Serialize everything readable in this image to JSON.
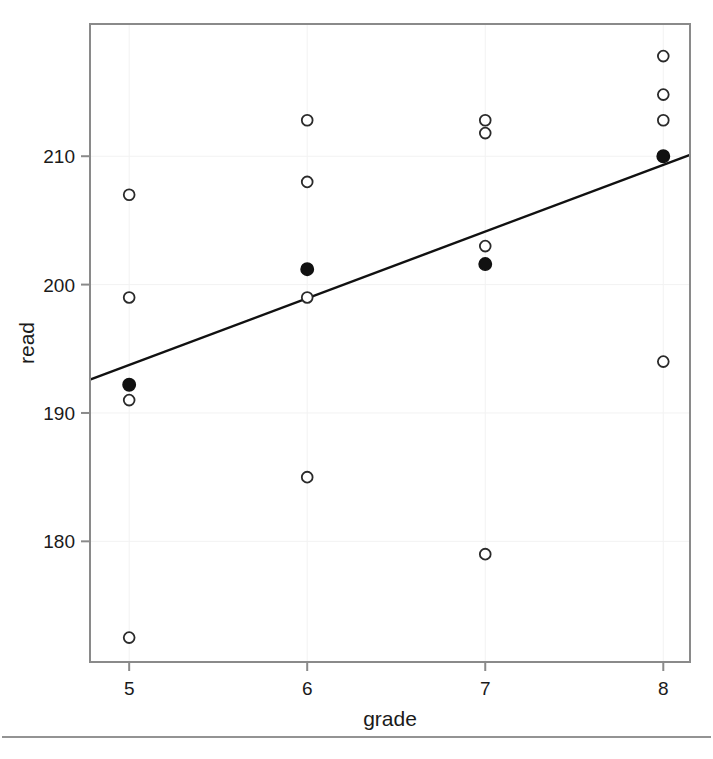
{
  "chart_data": {
    "type": "scatter",
    "title": "",
    "xlabel": "grade",
    "ylabel": "read",
    "xlim": [
      4.78,
      8.15
    ],
    "ylim": [
      170.6,
      220.3
    ],
    "xticks": [
      5,
      6,
      7,
      8
    ],
    "xtick_labels": [
      "5",
      "6",
      "7",
      "8"
    ],
    "yticks": [
      180,
      190,
      200,
      210
    ],
    "ytick_labels": [
      "180",
      "190",
      "200",
      "210"
    ],
    "grid": "faint",
    "legend": "none",
    "series": [
      {
        "name": "individual observations",
        "marker": "open-circle",
        "color": "#2a2a2a",
        "points": [
          {
            "x": 5,
            "y": 207
          },
          {
            "x": 5,
            "y": 199
          },
          {
            "x": 5,
            "y": 191
          },
          {
            "x": 5,
            "y": 172.5
          },
          {
            "x": 6,
            "y": 212.8
          },
          {
            "x": 6,
            "y": 208
          },
          {
            "x": 6,
            "y": 199
          },
          {
            "x": 6,
            "y": 185
          },
          {
            "x": 7,
            "y": 212.8
          },
          {
            "x": 7,
            "y": 211.8
          },
          {
            "x": 7,
            "y": 203
          },
          {
            "x": 7,
            "y": 179
          },
          {
            "x": 8,
            "y": 217.8
          },
          {
            "x": 8,
            "y": 214.8
          },
          {
            "x": 8,
            "y": 212.8
          },
          {
            "x": 8,
            "y": 194
          }
        ]
      },
      {
        "name": "group means",
        "marker": "filled-circle",
        "color": "#111111",
        "points": [
          {
            "x": 5,
            "y": 192.2
          },
          {
            "x": 6,
            "y": 201.2
          },
          {
            "x": 7,
            "y": 201.6
          },
          {
            "x": 8,
            "y": 210.0
          }
        ]
      }
    ],
    "fit_line": {
      "name": "regression line",
      "color": "#111111",
      "x_start": 4.78,
      "y_start": 192.6,
      "x_end": 8.15,
      "y_end": 210.1
    }
  },
  "axes": {
    "x_axis_title": "grade",
    "y_axis_title": "read"
  }
}
